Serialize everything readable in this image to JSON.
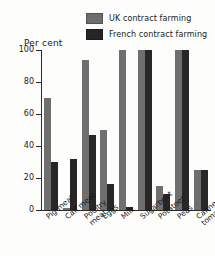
{
  "chart_data": {
    "type": "bar",
    "title": "",
    "xlabel": "",
    "ylabel": "Per cent",
    "ylim": [
      0,
      100
    ],
    "yticks": [
      0,
      20,
      40,
      60,
      80,
      100
    ],
    "grid": false,
    "legend_position": "top-right",
    "categories": [
      "Pig meat",
      "Calf meat",
      "Poultry meat",
      "Eggs",
      "Milk",
      "Sugarbeet",
      "Potatoes",
      "Peas",
      "Canned tomatoes"
    ],
    "series": [
      {
        "name": "UK contract farming",
        "color": "#6f6f6f",
        "values": [
          70,
          1,
          94,
          50,
          100,
          100,
          15,
          100,
          25
        ]
      },
      {
        "name": "French contract farming",
        "color": "#272727",
        "values": [
          30,
          32,
          47,
          16,
          2,
          100,
          10,
          100,
          25
        ]
      }
    ]
  },
  "axis": {
    "y_title": "Per cent",
    "tick_labels": [
      "100",
      "80",
      "60",
      "40",
      "20",
      "0"
    ]
  },
  "legend": {
    "items": [
      {
        "label": "UK contract farming",
        "swatch": "uk-swatch-icon"
      },
      {
        "label": "French contract farming",
        "swatch": "french-swatch-icon"
      }
    ]
  }
}
